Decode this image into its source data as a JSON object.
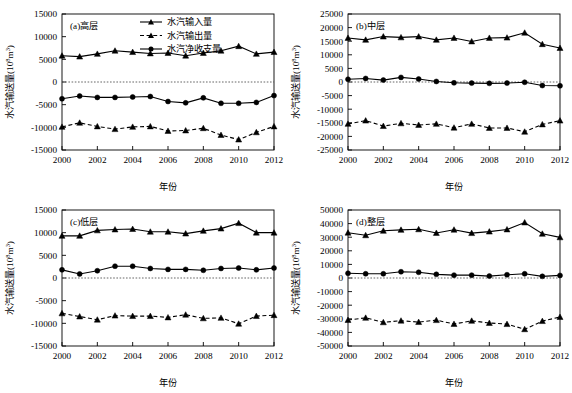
{
  "figure": {
    "layout": "2x2 grid of line charts",
    "panels_order": [
      "a",
      "b",
      "c",
      "d"
    ]
  },
  "legend": {
    "position": "top-center of panel (a)",
    "entries": [
      {
        "key": "input",
        "label": "水汽输入量",
        "marker": "triangle",
        "linestyle": "solid",
        "color": "#000000"
      },
      {
        "key": "output",
        "label": "水汽输出量",
        "marker": "triangle",
        "linestyle": "dashed",
        "color": "#000000"
      },
      {
        "key": "net",
        "label": "水汽净收支量",
        "marker": "circle",
        "linestyle": "solid",
        "color": "#000000"
      }
    ]
  },
  "chart_data": [
    {
      "id": "a",
      "type": "line",
      "title": "(a)高层",
      "xlabel": "年份",
      "ylabel": "水汽输送量(10⁸m³)",
      "x": [
        2000,
        2001,
        2002,
        2003,
        2004,
        2005,
        2006,
        2007,
        2008,
        2009,
        2010,
        2011,
        2012
      ],
      "xlim": [
        2000,
        2012
      ],
      "xticks": [
        2000,
        2002,
        2004,
        2006,
        2008,
        2010,
        2012
      ],
      "ylim": [
        -15000,
        15000
      ],
      "yticks": [
        -15000,
        -10000,
        -5000,
        0,
        5000,
        10000,
        15000
      ],
      "grid": false,
      "zeroline": true,
      "series": [
        {
          "name": "水汽输入量",
          "values": [
            5800,
            5600,
            6200,
            6900,
            6600,
            6300,
            6400,
            5800,
            6400,
            6900,
            7900,
            6200,
            6600
          ]
        },
        {
          "name": "水汽输出量",
          "values": [
            -9900,
            -9000,
            -9800,
            -10400,
            -9900,
            -9800,
            -10800,
            -10700,
            -10200,
            -11700,
            -12700,
            -11100,
            -9800
          ]
        },
        {
          "name": "水汽净收支量",
          "values": [
            -3700,
            -3100,
            -3400,
            -3400,
            -3300,
            -3200,
            -4300,
            -4600,
            -3500,
            -4700,
            -4700,
            -4500,
            -3000
          ]
        }
      ]
    },
    {
      "id": "b",
      "type": "line",
      "title": "(b)中层",
      "xlabel": "年份",
      "ylabel": "水汽输送量(10⁸m³)",
      "x": [
        2000,
        2001,
        2002,
        2003,
        2004,
        2005,
        2006,
        2007,
        2008,
        2009,
        2010,
        2011,
        2012
      ],
      "xlim": [
        2000,
        2012
      ],
      "xticks": [
        2000,
        2002,
        2004,
        2006,
        2008,
        2010,
        2012
      ],
      "ylim": [
        -25000,
        25000
      ],
      "yticks": [
        -25000,
        -20000,
        -15000,
        -10000,
        -5000,
        0,
        5000,
        10000,
        15000,
        20000,
        25000
      ],
      "grid": false,
      "zeroline": true,
      "series": [
        {
          "name": "水汽输入量",
          "values": [
            16200,
            15500,
            16700,
            16400,
            16700,
            15500,
            16200,
            14900,
            16200,
            16300,
            18100,
            13900,
            12500
          ]
        },
        {
          "name": "水汽输出量",
          "values": [
            -15400,
            -14200,
            -16200,
            -15200,
            -15800,
            -15400,
            -16800,
            -15400,
            -16900,
            -16900,
            -18300,
            -15600,
            -14200
          ]
        },
        {
          "name": "水汽净收支量",
          "values": [
            1000,
            1300,
            700,
            1700,
            1100,
            200,
            -300,
            -400,
            -500,
            -400,
            -100,
            -1300,
            -1400
          ]
        }
      ]
    },
    {
      "id": "c",
      "type": "line",
      "title": "(c)低层",
      "xlabel": "年份",
      "ylabel": "水汽输送量(10⁸m³)",
      "x": [
        2000,
        2001,
        2002,
        2003,
        2004,
        2005,
        2006,
        2007,
        2008,
        2009,
        2010,
        2011,
        2012
      ],
      "xlim": [
        2000,
        2012
      ],
      "xticks": [
        2000,
        2002,
        2004,
        2006,
        2008,
        2010,
        2012
      ],
      "ylim": [
        -15000,
        15000
      ],
      "yticks": [
        -15000,
        -10000,
        -5000,
        0,
        5000,
        10000,
        15000
      ],
      "grid": false,
      "zeroline": true,
      "series": [
        {
          "name": "水汽输入量",
          "values": [
            9300,
            9300,
            10500,
            10700,
            10800,
            10200,
            10200,
            9800,
            10400,
            10900,
            12100,
            10000,
            10000
          ]
        },
        {
          "name": "水汽输出量",
          "values": [
            -7800,
            -8500,
            -9200,
            -8300,
            -8400,
            -8400,
            -8700,
            -8100,
            -8900,
            -8800,
            -10100,
            -8400,
            -8200
          ]
        },
        {
          "name": "水汽净收支量",
          "values": [
            1800,
            900,
            1600,
            2600,
            2600,
            2100,
            1900,
            1900,
            1700,
            2100,
            2200,
            1800,
            2200
          ]
        }
      ]
    },
    {
      "id": "d",
      "type": "line",
      "title": "(d)整层",
      "xlabel": "年份",
      "ylabel": "水汽输送量(10⁸m³)",
      "x": [
        2000,
        2001,
        2002,
        2003,
        2004,
        2005,
        2006,
        2007,
        2008,
        2009,
        2010,
        2011,
        2012
      ],
      "xlim": [
        -50000,
        50000
      ],
      "xticks": [
        2000,
        2002,
        2004,
        2006,
        2008,
        2010,
        2012
      ],
      "ylim": [
        -50000,
        50000
      ],
      "yticks": [
        -50000,
        -40000,
        -30000,
        -20000,
        -10000,
        0,
        10000,
        20000,
        30000,
        40000,
        50000
      ],
      "grid": false,
      "zeroline": true,
      "series": [
        {
          "name": "水汽输入量",
          "values": [
            33300,
            31400,
            34700,
            35400,
            35800,
            33100,
            35500,
            33000,
            34100,
            35700,
            40800,
            32500,
            29900
          ]
        },
        {
          "name": "水汽输出量",
          "values": [
            -30900,
            -29300,
            -32600,
            -31400,
            -32400,
            -31000,
            -33800,
            -31500,
            -33100,
            -33900,
            -37700,
            -31700,
            -28700
          ]
        },
        {
          "name": "水汽净收支量",
          "values": [
            3500,
            3100,
            3100,
            4600,
            4200,
            2700,
            2100,
            2100,
            1400,
            2400,
            3100,
            1200,
            1900
          ]
        }
      ]
    }
  ]
}
